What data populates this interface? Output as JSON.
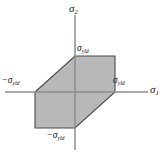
{
  "figure": {
    "background_color": "#ffffff",
    "axis_color": "#8c8c8c",
    "fill_color": "#b8b8b8",
    "outline_color": "#4a4a4a",
    "text_color": "#1a1a1a"
  },
  "axes": {
    "x_axis": {
      "name": "sigma-1-axis",
      "label_sigma": "σ",
      "label_sub": "1"
    },
    "y_axis": {
      "name": "sigma-2-axis",
      "label_sigma": "σ",
      "label_sub": "2"
    }
  },
  "tick_labels": {
    "positive_y": {
      "minus": "",
      "sigma": "σ",
      "sub": "yld"
    },
    "negative_y": {
      "minus": "−",
      "sigma": "σ",
      "sub": "yld"
    },
    "positive_x": {
      "minus": "",
      "sigma": "σ",
      "sub": "yld"
    },
    "negative_x": {
      "minus": "−",
      "sigma": "σ",
      "sub": "yld"
    }
  },
  "chart_data": {
    "type": "line",
    "xlabel": "σ₁",
    "ylabel": "σ₂",
    "xlim": [
      -1.6,
      1.9
    ],
    "ylim": [
      -1.75,
      1.9
    ],
    "grid": false,
    "legend": null,
    "annotations": [
      {
        "text": "σ_yld",
        "axis": "y",
        "value": 1
      },
      {
        "text": "−σ_yld",
        "axis": "y",
        "value": -1
      },
      {
        "text": "σ_yld",
        "axis": "x",
        "value": 1
      },
      {
        "text": "−σ_yld",
        "axis": "x",
        "value": -1
      }
    ],
    "series": [
      {
        "name": "Tresca yield locus",
        "closed": true,
        "filled": true,
        "fill": "#b8b8b8",
        "stroke": "#4a4a4a",
        "x": [
          -1,
          0,
          1,
          1,
          0,
          -1
        ],
        "y": [
          0,
          1,
          1,
          0,
          -1,
          -1
        ],
        "vertices": [
          {
            "x": -1,
            "y": 0
          },
          {
            "x": 0,
            "y": 1
          },
          {
            "x": 1,
            "y": 1
          },
          {
            "x": 1,
            "y": 0
          },
          {
            "x": 0,
            "y": -1
          },
          {
            "x": -1,
            "y": -1
          }
        ]
      }
    ]
  }
}
